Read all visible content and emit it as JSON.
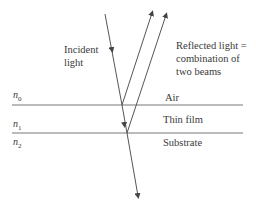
{
  "diagram": {
    "labels": {
      "incident": [
        "Incident",
        "light"
      ],
      "reflected": [
        "Reflected light =",
        "combination of",
        "two beams"
      ],
      "air": "Air",
      "thin_film": "Thin film",
      "substrate": "Substrate"
    },
    "indices": [
      {
        "symbol": "n",
        "sub": "0"
      },
      {
        "symbol": "n",
        "sub": "1"
      },
      {
        "symbol": "n",
        "sub": "2"
      }
    ],
    "colors": {
      "line": "#555555",
      "text": "#3a3a3a",
      "background": "#ffffff"
    }
  }
}
